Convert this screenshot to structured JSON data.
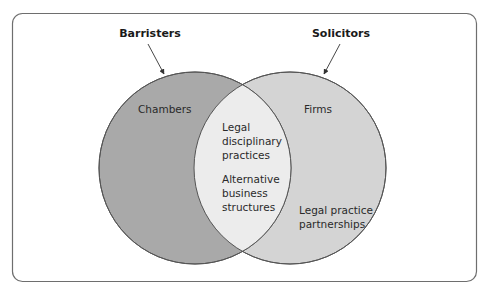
{
  "diagram": {
    "type": "venn",
    "colors": {
      "frame_stroke": "#6e6e6e",
      "left_fill": "#a9a9a9",
      "right_fill": "#d4d4d4",
      "overlap_fill": "#ececec",
      "circle_stroke": "#555555",
      "text": "#2a2a2a"
    },
    "sets": [
      {
        "name": "Barristers",
        "region_label": "Chambers"
      },
      {
        "name": "Solicitors",
        "region_label": "Firms",
        "extra_label": [
          "Legal practice",
          "partnerships"
        ]
      }
    ],
    "overlap": {
      "items": [
        [
          "Legal",
          "disciplinary",
          "practices"
        ],
        [
          "Alternative",
          "business",
          "structures"
        ]
      ]
    }
  }
}
